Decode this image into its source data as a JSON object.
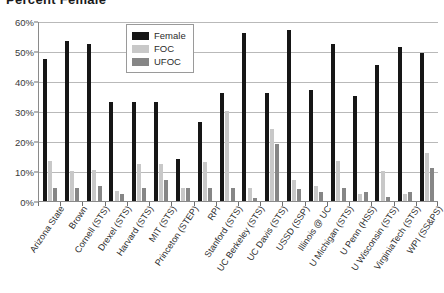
{
  "title": "Percent Female",
  "legend": {
    "position": "inside-top-center",
    "entries": [
      {
        "label": "Female",
        "color": "#161616",
        "key": "female"
      },
      {
        "label": "FOC",
        "color": "#c8c8c8",
        "key": "foc"
      },
      {
        "label": "UFOC",
        "color": "#868686",
        "key": "ufoc"
      }
    ]
  },
  "yaxis": {
    "ticks": [
      "0%",
      "10%",
      "20%",
      "30%",
      "40%",
      "50%",
      "60%"
    ],
    "min": 0,
    "max": 60,
    "step": 10
  },
  "chart_data": {
    "type": "bar",
    "title": "Percent Female",
    "xlabel": "",
    "ylabel": "",
    "ylim": [
      0,
      60
    ],
    "ytick_labels": [
      "0%",
      "10%",
      "20%",
      "30%",
      "40%",
      "50%",
      "60%"
    ],
    "grid": true,
    "legend_position": "inside-top-center",
    "units": "percent",
    "categories": [
      "Arizona State",
      "Brown",
      "Cornell (STS)",
      "Drexel (STS)",
      "Harvard (STS)",
      "MIT (STS)",
      "Princeton (STEP)",
      "RPI",
      "Stanford (STS)",
      "UC Berkeley (STS)",
      "UC Davis (STS)",
      "USSD (SSP)",
      "Illinois @ UC",
      "U Michigan (STS)",
      "U Penn (HSS)",
      "U Wisconsin (STS)",
      "VirginiaTech (STS)",
      "WPI (SS&PS)"
    ],
    "series": [
      {
        "name": "Female",
        "color": "#161616",
        "values": [
          47.5,
          53.5,
          52.5,
          33,
          33,
          33,
          14,
          26.5,
          36,
          56,
          36,
          57,
          37,
          52.5,
          35,
          45.5,
          51.5,
          49.5
        ]
      },
      {
        "name": "FOC",
        "color": "#c8c8c8",
        "values": [
          13.5,
          10,
          10.5,
          3.5,
          12.5,
          12.5,
          4.5,
          13,
          30,
          4.5,
          24,
          7,
          5,
          13.5,
          2.5,
          10,
          2.5,
          16
        ]
      },
      {
        "name": "UFOC",
        "color": "#868686",
        "values": [
          4.5,
          4.5,
          5,
          2.5,
          4.5,
          7,
          4.5,
          4.5,
          4.5,
          1,
          19,
          4,
          3,
          4.5,
          3,
          1.5,
          3,
          11
        ]
      }
    ]
  }
}
